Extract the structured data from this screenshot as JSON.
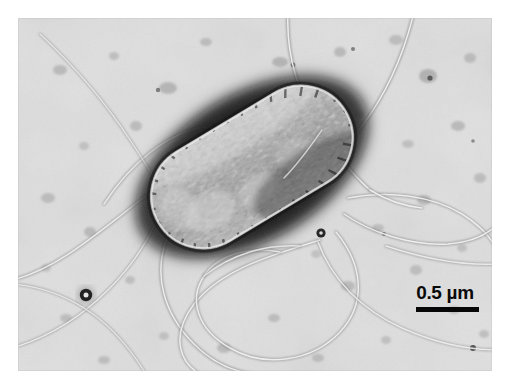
{
  "figure": {
    "kind": "transmission-electron-micrograph",
    "background_color": "#dcdcdc",
    "page_color": "#ffffff",
    "frame": {
      "x": 18,
      "y": 18,
      "width": 474,
      "height": 353
    }
  },
  "scalebar": {
    "label": "0.5 µm",
    "value": "0.5",
    "unit": "µm",
    "bar_color": "#070707",
    "text_color": "#0a0a0a",
    "bar_length_px": 63
  },
  "cell": {
    "name": "bacterium",
    "shape": "rod",
    "angle_deg": -31,
    "center_x": 252,
    "center_y": 167,
    "length": 218,
    "width": 104,
    "halo_color": "#1a1a1a",
    "body_color": "#b4b4b4",
    "texture": "granular-striated"
  },
  "flagella": {
    "count": 9,
    "stroke_color": "#8c8c8c",
    "highlight_color": "#f2f2f2",
    "description": "peritrichous curved filaments looping across the field"
  },
  "debris": {
    "count": 44,
    "description": "stain granules and dark speckles on the support film"
  }
}
